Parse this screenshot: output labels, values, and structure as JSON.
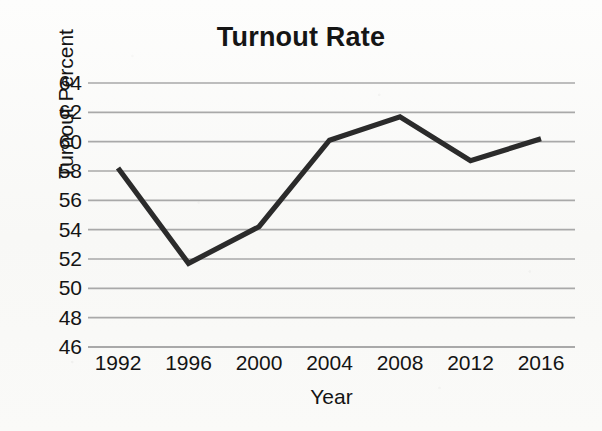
{
  "chart_data": {
    "type": "line",
    "title": "Turnout Rate",
    "xlabel": "Year",
    "ylabel": "Turnout Percent",
    "categories": [
      "1992",
      "1996",
      "2000",
      "2004",
      "2008",
      "2012",
      "2016"
    ],
    "x": [
      1992,
      1996,
      2000,
      2004,
      2008,
      2012,
      2016
    ],
    "values": [
      58.2,
      51.7,
      54.2,
      60.1,
      61.7,
      58.7,
      60.2
    ],
    "series": [
      {
        "name": "Turnout Rate",
        "values": [
          58.2,
          51.7,
          54.2,
          60.1,
          61.7,
          58.7,
          60.2
        ]
      }
    ],
    "ylim": [
      46,
      64
    ],
    "yticks": [
      46,
      48,
      50,
      52,
      54,
      56,
      58,
      60,
      62,
      64
    ],
    "ytick_labels": [
      "46",
      "48",
      "50",
      "52",
      "54",
      "56",
      "58",
      "60",
      "62",
      "64"
    ],
    "xtick_labels": [
      "1992",
      "1996",
      "2000",
      "2004",
      "2008",
      "2012",
      "2016"
    ],
    "grid": "horizontal",
    "legend": "none",
    "line_color": "#2b2b2b",
    "grid_color": "#a9a9a9",
    "background_color": "#fbfbfa"
  }
}
